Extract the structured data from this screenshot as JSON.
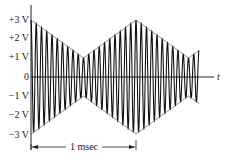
{
  "chart_data": {
    "type": "line",
    "title": "",
    "xlabel": "t",
    "ylabel": "",
    "ylim": [
      -3,
      3
    ],
    "yticks": [
      "+3 V",
      "+2 V",
      "+1 V",
      "0",
      "-1 V",
      "-2 V",
      "-3 V"
    ],
    "annotations": [
      {
        "text": "1 msec",
        "span_ms": [
          0,
          1
        ]
      }
    ],
    "envelope": {
      "x_ms": [
        0,
        0.5,
        1.0,
        1.5,
        1.6
      ],
      "amplitude_V": [
        3,
        1,
        3,
        1,
        1.4
      ]
    },
    "carrier_cycles_per_ms": 20,
    "series": [
      {
        "name": "upper envelope",
        "x": [
          0,
          0.5,
          1.0,
          1.5,
          1.6
        ],
        "values": [
          3,
          1,
          3,
          1,
          1.4
        ]
      },
      {
        "name": "lower envelope",
        "x": [
          0,
          0.5,
          1.0,
          1.5,
          1.6
        ],
        "values": [
          -3,
          -1,
          -3,
          -1,
          -1.4
        ]
      }
    ]
  },
  "labels": {
    "y3": "+3 V",
    "y2": "+2 V",
    "y1": "+1 V",
    "y0": "0",
    "yn1": "−1 V",
    "yn2": "−2 V",
    "yn3": "−3 V",
    "t": "t",
    "span": "1 msec"
  }
}
